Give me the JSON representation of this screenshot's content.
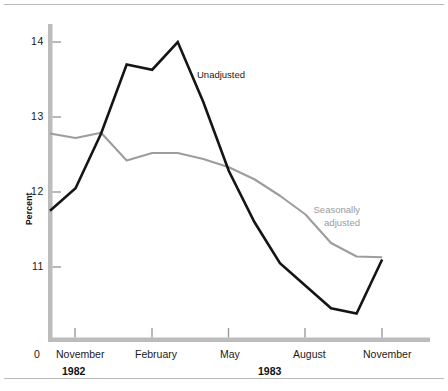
{
  "chart_data": {
    "type": "line",
    "title": "",
    "subtitle": "",
    "xlabel": "",
    "ylabel": "Percent",
    "ylim": [
      10.25,
      14.35
    ],
    "yticks": [
      11,
      12,
      13,
      14
    ],
    "ytick_labels": [
      "11",
      "12",
      "13",
      "14"
    ],
    "y_origin_label": "0",
    "grid": false,
    "legend_position": "inline-annotations",
    "x_axis": {
      "tick_labels": [
        "November",
        "February",
        "May",
        "August",
        "November"
      ],
      "tick_months": [
        "1982-11",
        "1983-02",
        "1983-05",
        "1983-08",
        "1983-11"
      ],
      "group_labels": [
        "1982",
        "1983"
      ]
    },
    "x": [
      "1982-10",
      "1982-11",
      "1982-12",
      "1983-01",
      "1983-02",
      "1983-03",
      "1983-04",
      "1983-05",
      "1983-06",
      "1983-07",
      "1983-08",
      "1983-09",
      "1983-10",
      "1983-11"
    ],
    "series": [
      {
        "name": "Unadjusted",
        "color": "#151515",
        "values": [
          11.75,
          12.05,
          12.78,
          13.7,
          13.63,
          14.0,
          13.2,
          12.28,
          11.6,
          11.05,
          10.75,
          10.45,
          10.38,
          11.1
        ]
      },
      {
        "name": "Seasonally adjusted",
        "color": "#9d9d9d",
        "values": [
          12.78,
          12.72,
          12.79,
          12.42,
          12.52,
          12.52,
          12.44,
          12.33,
          12.17,
          11.95,
          11.7,
          11.32,
          11.14,
          11.13
        ]
      }
    ],
    "annotations": [
      {
        "text": "Unadjusted",
        "series": "Unadjusted"
      },
      {
        "text": "Seasonally",
        "series": "Seasonally adjusted"
      },
      {
        "text": "adjusted",
        "series": "Seasonally adjusted"
      }
    ]
  },
  "axis": {
    "y_title": "Percent",
    "zero": "0",
    "ytick_0": "14",
    "ytick_1": "13",
    "ytick_2": "12",
    "ytick_3": "11",
    "xtick_0": "November",
    "xtick_1": "February",
    "xtick_2": "May",
    "xtick_3": "August",
    "xtick_4": "November",
    "year_0": "1982",
    "year_1": "1983"
  },
  "notes": {
    "unadjusted": "Unadjusted",
    "seasonal_line1": "Seasonally",
    "seasonal_line2": "adjusted"
  },
  "colors": {
    "unadjusted": "#151515",
    "seasonal": "#9d9d9d",
    "axis": "#bcbcbc",
    "rule": "#b9b9b9",
    "text": "#1a1a1a"
  }
}
